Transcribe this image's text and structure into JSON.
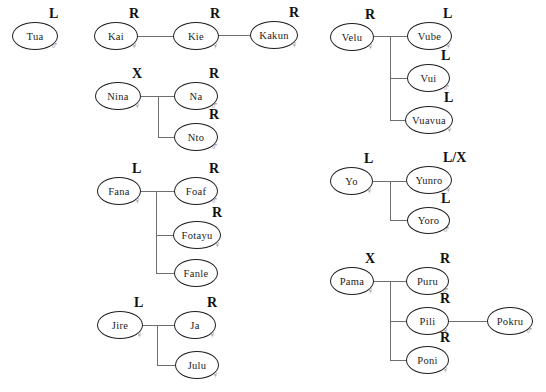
{
  "figure": {
    "type": "kinship-diagram",
    "background": "#ffffff"
  },
  "people": {
    "tua": {
      "name": "Tua",
      "label": "L",
      "sex": "male",
      "sex_symbol": "♂"
    },
    "kai": {
      "name": "Kai",
      "label": "R",
      "sex": "female",
      "sex_symbol": "♀"
    },
    "kie": {
      "name": "Kie",
      "label": "R",
      "sex": "female",
      "sex_symbol": "♀"
    },
    "kakun": {
      "name": "Kakun",
      "label": "R",
      "sex": "female",
      "sex_symbol": "♀"
    },
    "nina": {
      "name": "Nina",
      "label": "X",
      "sex": "female",
      "sex_symbol": "♀"
    },
    "na": {
      "name": "Na",
      "label": "R",
      "sex": "male",
      "sex_symbol": "♂"
    },
    "nto": {
      "name": "Nto",
      "label": "R",
      "sex": "male",
      "sex_symbol": "♂"
    },
    "fana": {
      "name": "Fana",
      "label": "L",
      "sex": "female",
      "sex_symbol": "♀"
    },
    "foaf": {
      "name": "Foaf",
      "label": "R",
      "sex": "male",
      "sex_symbol": "♂"
    },
    "fotayu": {
      "name": "Fotayu",
      "label": "R",
      "sex": "female",
      "sex_symbol": "♀"
    },
    "fanle": {
      "name": "Fanle",
      "label": "",
      "sex": "",
      "sex_symbol": ""
    },
    "jire": {
      "name": "Jire",
      "label": "L",
      "sex": "female",
      "sex_symbol": "♀"
    },
    "ja": {
      "name": "Ja",
      "label": "R",
      "sex": "female",
      "sex_symbol": "♀"
    },
    "julu": {
      "name": "Julu",
      "label": "",
      "sex": "female",
      "sex_symbol": "♀"
    },
    "velu": {
      "name": "Velu",
      "label": "R",
      "sex": "female",
      "sex_symbol": "♀"
    },
    "vube": {
      "name": "Vube",
      "label": "L",
      "sex": "female",
      "sex_symbol": "♀"
    },
    "vui": {
      "name": "Vui",
      "label": "L",
      "sex": "male",
      "sex_symbol": "♂"
    },
    "vuavua": {
      "name": "Vuavua",
      "label": "L",
      "sex": "female",
      "sex_symbol": "♀"
    },
    "yo": {
      "name": "Yo",
      "label": "L",
      "sex": "female",
      "sex_symbol": "♀"
    },
    "yunro": {
      "name": "Yunro",
      "label": "L/X",
      "sex": "female",
      "sex_symbol": "♀"
    },
    "yoro": {
      "name": "Yoro",
      "label": "L",
      "sex": "male",
      "sex_symbol": "♂"
    },
    "pama": {
      "name": "Pama",
      "label": "X",
      "sex": "female",
      "sex_symbol": "♀"
    },
    "puru": {
      "name": "Puru",
      "label": "R",
      "sex": "male",
      "sex_symbol": "♂"
    },
    "pili": {
      "name": "Pili",
      "label": "R",
      "sex": "female",
      "sex_symbol": "♀"
    },
    "pokru": {
      "name": "Pokru",
      "label": "",
      "sex": "male",
      "sex_symbol": "♂"
    },
    "poni": {
      "name": "Poni",
      "label": "R",
      "sex": "female",
      "sex_symbol": "♀"
    }
  },
  "relationships": {
    "isolated": [
      "Tua"
    ],
    "chains": [
      [
        "Kai",
        "Kie",
        "Kakun"
      ],
      [
        "Pili",
        "Pokru"
      ]
    ],
    "parent_child": [
      {
        "parent": "Nina",
        "children": [
          "Na",
          "Nto"
        ]
      },
      {
        "parent": "Fana",
        "children": [
          "Foaf",
          "Fotayu",
          "Fanle"
        ]
      },
      {
        "parent": "Jire",
        "children": [
          "Ja",
          "Julu"
        ]
      },
      {
        "parent": "Velu",
        "children": [
          "Vube",
          "Vui",
          "Vuavua"
        ]
      },
      {
        "parent": "Yo",
        "children": [
          "Yunro",
          "Yoro"
        ]
      },
      {
        "parent": "Pama",
        "children": [
          "Puru",
          "Pili",
          "Poni"
        ]
      }
    ]
  },
  "colors": {
    "background": "#ffffff",
    "ellipse_border": "#1f1f1f",
    "name_text": "#1c1c1c",
    "label_text": "#101010",
    "sex_symbol": "#7d7d7d",
    "connector_line": "#6e6e6e"
  }
}
